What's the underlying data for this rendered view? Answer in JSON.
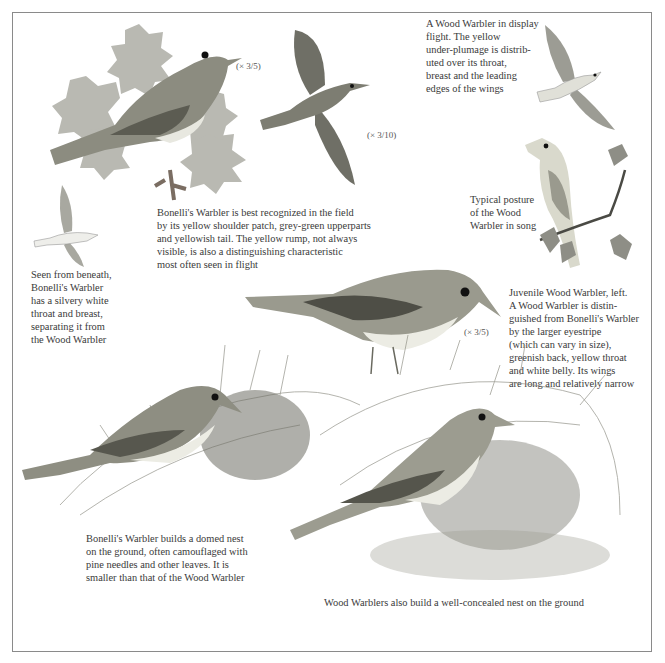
{
  "page": {
    "captions": {
      "display_flight": "A Wood Warbler in display\nflight. The yellow\nunder-plumage is distrib-\nuted over its throat,\nbreast and the leading\nedges of the wings",
      "bonelli_field": "Bonelli's Warbler is best recognized in the field\nby its yellow shoulder patch, grey-green upperparts\nand yellowish tail. The yellow rump, not always\nvisible, is also a distinguishing characteristic\nmost often seen in flight",
      "beneath": "Seen from beneath,\nBonelli's Warbler\nhas a silvery white\nthroat and breast,\nseparating it from\nthe Wood Warbler",
      "song_posture": "Typical posture\nof the Wood\nWarbler in song",
      "juvenile": "Juvenile Wood Warbler, left.\nA Wood Warbler is distin-\nguished from Bonelli's Warbler\nby the larger eyestripe\n(which can vary in size),\ngreenish back, yellow throat\nand white belly. Its wings\nare long and relatively narrow",
      "bonelli_nest": "Bonelli's Warbler builds a domed nest\non the ground, often camouflaged with\npine needles and other leaves. It is\nsmaller than that of the Wood Warbler",
      "wood_nest": "Wood Warblers also build a well-concealed nest on the ground"
    },
    "scales": {
      "perched_bonelli": "(× 3/5)",
      "flying_bonelli": "(× 3/10)",
      "juvenile": "(× 3/5)"
    },
    "illustrations": [
      "perched-bonellis-warbler-on-oak",
      "flying-bonellis-warbler-top-view",
      "wood-warbler-display-flight",
      "wood-warbler-singing-on-twig",
      "bonellis-warbler-from-beneath",
      "juvenile-wood-warbler",
      "bonellis-warbler-at-domed-nest",
      "wood-warbler-at-ground-nest"
    ],
    "colors": {
      "frame": "#8a8a8a",
      "text": "#3a3a3a",
      "plumage_dark": "#5a5a50",
      "plumage_mid": "#8c8c80",
      "leaf": "#a8a8a0"
    }
  }
}
